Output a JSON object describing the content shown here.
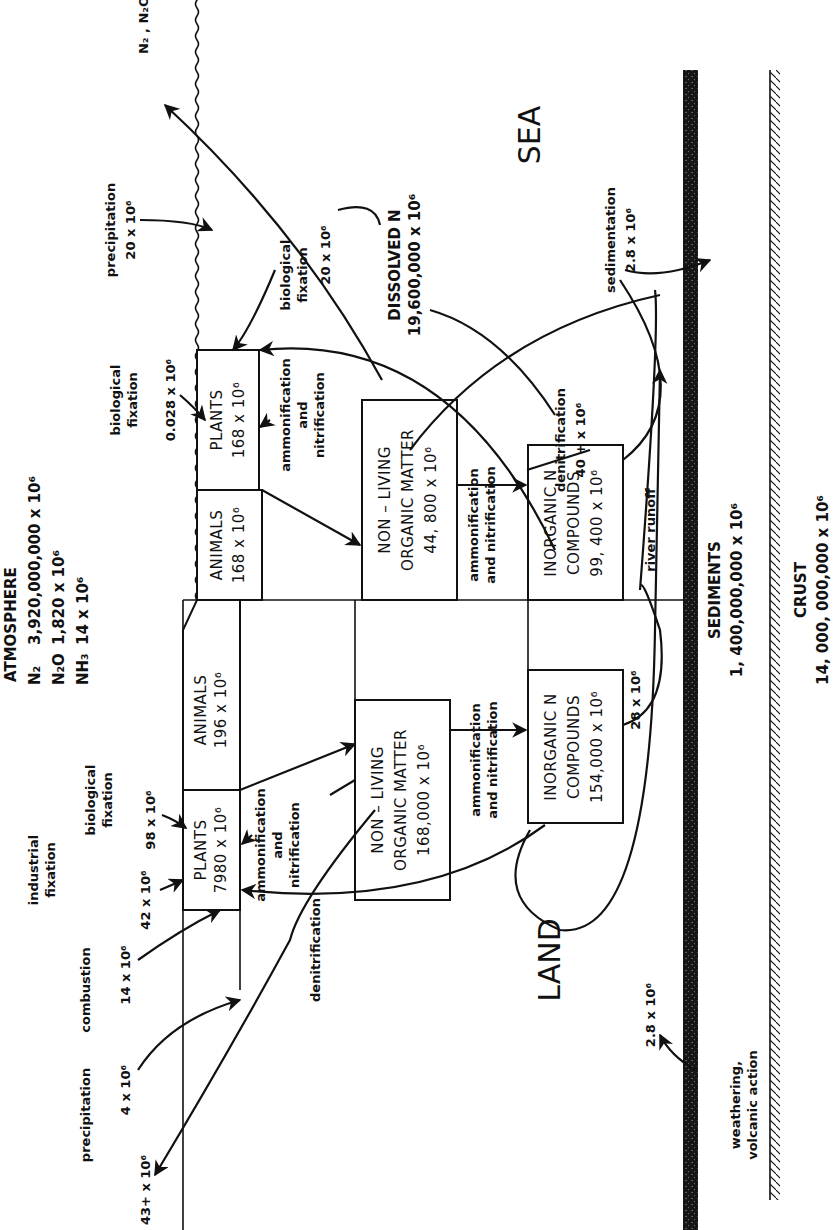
{
  "atmosphere": {
    "title": "ATMOSPHERE",
    "n2_label": "N₂",
    "n2_value": "3,920,000,000 x 10⁶",
    "n2o_label": "N₂O",
    "n2o_value": "1,820 x 10⁶",
    "nh3_label": "NH₃",
    "nh3_value": "14 x 10⁶"
  },
  "regions": {
    "land": "LAND",
    "sea": "SEA",
    "sediments_title": "SEDIMENTS",
    "sediments_value": "1, 400,000,000 x 10⁶",
    "crust_title": "CRUST",
    "crust_value": "14, 000, 000,000 x 10⁶"
  },
  "land": {
    "plants": {
      "title": "PLANTS",
      "value": "7980 x 10⁶"
    },
    "animals": {
      "title": "ANIMALS",
      "value": "196 x 10⁶"
    },
    "nonliving": {
      "line1": "NON – LIVING",
      "line2": "ORGANIC MATTER",
      "value": "168,000 x 10⁶"
    },
    "inorganic": {
      "line1": "INORGANIC N",
      "line2": "COMPOUNDS",
      "value": "154,000 x 10⁶"
    },
    "flows": {
      "precipitation_label": "precipitation",
      "precipitation_value": "4 x 10⁶",
      "combustion_label": "combustion",
      "combustion_value": "14 x 10⁶",
      "industrial_label1": "industrial",
      "industrial_label2": "fixation",
      "industrial_value": "42 x 10⁶",
      "bio_label1": "biological",
      "bio_label2": "fixation",
      "bio_value": "98 x 10⁶",
      "denit_value": "43+ x 10⁶",
      "denit_label": "denitrification",
      "amm1_l1": "ammonification",
      "amm1_l2": "and",
      "amm1_l3": "nitrification",
      "amm2_l1": "ammonification",
      "amm2_l2": "and nitrification",
      "river_value": "28 x 10⁶",
      "weathering_value": "2.8 x 10⁶",
      "weathering_l1": "weathering,",
      "weathering_l2": "volcanic action"
    }
  },
  "sea": {
    "plants": {
      "title": "PLANTS",
      "value": "168 x 10⁶"
    },
    "animals": {
      "title": "ANIMALS",
      "value": "168 x 10⁶"
    },
    "nonliving": {
      "line1": "NON – LIVING",
      "line2": "ORGANIC MATTER",
      "value": "44, 800 x 10⁶"
    },
    "inorganic": {
      "line1": "INORGANIC N",
      "line2": "COMPOUNDS",
      "value": "99, 400 x 10⁶"
    },
    "dissolved": {
      "title": "DISSOLVED N",
      "value": "19,600,000 x 10⁶"
    },
    "flows": {
      "n2_n2o": "N₂ , N₂O",
      "precipitation_label": "precipitation",
      "precipitation_value": "20 x 10⁶",
      "bio_label1": "biological",
      "bio_label2": "fixation",
      "bio_value": "20 x 10⁶",
      "bio2_label1": "biological",
      "bio2_label2": "fixation",
      "bio2_value": "0.028 x 10⁶",
      "amm1_l1": "ammonification",
      "amm1_l2": "and",
      "amm1_l3": "nitrification",
      "amm2_l1": "ammonification",
      "amm2_l2": "and nitrification",
      "denit_label": "denitrification",
      "denit_value": "40 + x 10⁶",
      "sed_label": "sedimentation",
      "sed_value": "2.8 x 10⁶",
      "river_label": "river runoff"
    }
  }
}
